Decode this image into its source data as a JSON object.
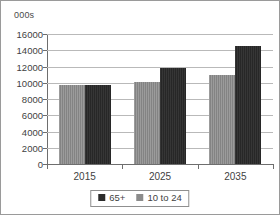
{
  "chart_data": {
    "type": "bar",
    "title": "",
    "subtitle": "",
    "unit_caption": "000s",
    "xlabel": "",
    "ylabel": "",
    "categories": [
      "2015",
      "2025",
      "2035"
    ],
    "series": [
      {
        "name": "65+",
        "key": "series-old",
        "color": "#2b2b2b",
        "values": [
          9700,
          11800,
          14500
        ]
      },
      {
        "name": "10 to 24",
        "key": "series-young",
        "color": "#8b8b8b",
        "values": [
          9700,
          10100,
          10900
        ]
      }
    ],
    "bar_order": [
      "10 to 24",
      "65+"
    ],
    "ylim": [
      0,
      16000
    ],
    "ytick_step": 2000,
    "yticks": [
      0,
      2000,
      4000,
      6000,
      8000,
      10000,
      12000,
      14000,
      16000
    ],
    "ytick_labels": [
      "0",
      "2000",
      "4000",
      "6000",
      "8000",
      "10000",
      "12000",
      "14000",
      "16000"
    ],
    "grid": {
      "horizontal": true,
      "vertical": false,
      "color": "#b9b9b9"
    },
    "legend": {
      "position": "bottom",
      "bordered": true,
      "entries": [
        {
          "label": "65+",
          "color": "#2b2b2b"
        },
        {
          "label": "10 to 24",
          "color": "#8b8b8b"
        }
      ]
    },
    "frame": {
      "border": true,
      "border_color": "#9a9a9a"
    },
    "axis_color": "#6e6e6e",
    "background": "#ffffff"
  }
}
